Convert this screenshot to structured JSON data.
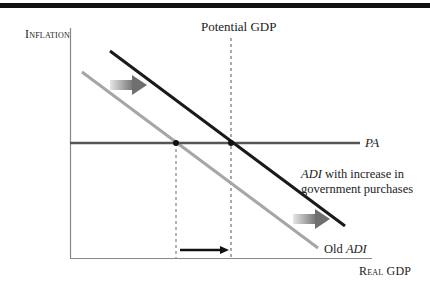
{
  "diagram": {
    "y_axis_label": "Inflation",
    "x_axis_label": "Real GDP",
    "potential_gdp_label": "Potential GDP",
    "pa_label": "PA",
    "new_adi_label_italic": "ADI",
    "new_adi_label_rest_line1": " with increase in",
    "new_adi_label_line2": "government purchases",
    "old_adi_label_prefix": "Old ",
    "old_adi_label_italic": "ADI",
    "colors": {
      "new_adi": "#1a1a1a",
      "old_adi": "#a6a6a6",
      "pa": "#555555",
      "axes": "#888888",
      "shift_arrow": "#777777",
      "output_arrow": "#111111"
    }
  }
}
